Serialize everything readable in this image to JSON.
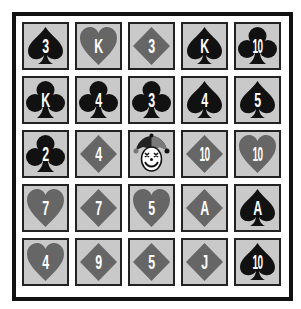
{
  "colors": {
    "black_suit": "#111111",
    "red_suit": "#666666",
    "cell_bg": "#c9c9c9",
    "frame": "#111111"
  },
  "board": {
    "rows": [
      [
        {
          "rank": "3",
          "suit": "spade"
        },
        {
          "rank": "K",
          "suit": "heart"
        },
        {
          "rank": "3",
          "suit": "diamond"
        },
        {
          "rank": "K",
          "suit": "spade"
        },
        {
          "rank": "10",
          "suit": "club"
        }
      ],
      [
        {
          "rank": "K",
          "suit": "club"
        },
        {
          "rank": "4",
          "suit": "club"
        },
        {
          "rank": "3",
          "suit": "club"
        },
        {
          "rank": "4",
          "suit": "spade"
        },
        {
          "rank": "5",
          "suit": "spade"
        }
      ],
      [
        {
          "rank": "2",
          "suit": "club"
        },
        {
          "rank": "4",
          "suit": "diamond"
        },
        {
          "rank": "",
          "suit": "joker"
        },
        {
          "rank": "10",
          "suit": "diamond"
        },
        {
          "rank": "10",
          "suit": "heart"
        }
      ],
      [
        {
          "rank": "7",
          "suit": "heart"
        },
        {
          "rank": "7",
          "suit": "diamond"
        },
        {
          "rank": "5",
          "suit": "heart"
        },
        {
          "rank": "A",
          "suit": "diamond"
        },
        {
          "rank": "A",
          "suit": "spade"
        }
      ],
      [
        {
          "rank": "4",
          "suit": "heart"
        },
        {
          "rank": "9",
          "suit": "diamond"
        },
        {
          "rank": "5",
          "suit": "diamond"
        },
        {
          "rank": "J",
          "suit": "diamond"
        },
        {
          "rank": "10",
          "suit": "spade"
        }
      ]
    ]
  }
}
